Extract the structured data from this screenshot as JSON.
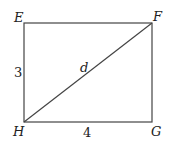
{
  "diagram": {
    "vertices": {
      "top_left": "E",
      "top_right": "F",
      "bottom_right": "G",
      "bottom_left": "H"
    },
    "side_labels": {
      "left": "3",
      "bottom": "4"
    },
    "diagonal_label": "d"
  }
}
